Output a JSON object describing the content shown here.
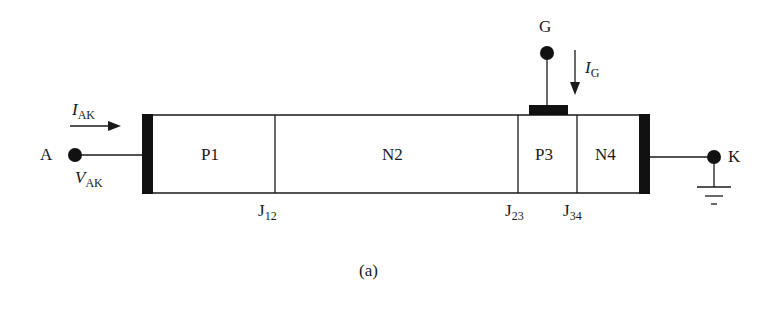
{
  "figure": {
    "caption": "(a)",
    "terminals": {
      "anode": "A",
      "cathode": "K",
      "gate": "G"
    },
    "currents": {
      "anode_current": {
        "symbol": "I",
        "subscript": "AK"
      },
      "gate_current": {
        "symbol": "I",
        "subscript": "G"
      }
    },
    "voltage": {
      "symbol": "V",
      "subscript": "AK"
    },
    "regions": [
      "P1",
      "N2",
      "P3",
      "N4"
    ],
    "junctions": [
      {
        "base": "J",
        "subscript": "12"
      },
      {
        "base": "J",
        "subscript": "23"
      },
      {
        "base": "J",
        "subscript": "34"
      }
    ],
    "colors": {
      "ink": "#1a1a1a",
      "background": "#ffffff"
    }
  }
}
